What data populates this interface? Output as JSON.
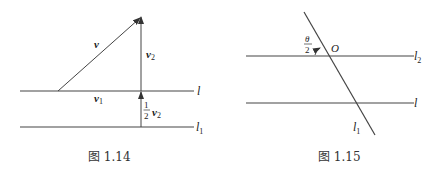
{
  "figures": [
    {
      "id": "fig-1-14",
      "caption": "图 1.14",
      "lines": [
        {
          "name": "l",
          "label": "l"
        },
        {
          "name": "l1",
          "label": "l",
          "sub": "1"
        }
      ],
      "vectors": [
        {
          "name": "v",
          "label": "v"
        },
        {
          "name": "v2",
          "label": "v",
          "sub": "2"
        },
        {
          "name": "v1",
          "label": "v",
          "sub": "1"
        },
        {
          "name": "half-v2",
          "frac_num": "1",
          "frac_den": "2",
          "label": "v",
          "sub": "2"
        }
      ]
    },
    {
      "id": "fig-1-15",
      "caption": "图 1.15",
      "lines": [
        {
          "name": "l2",
          "label": "l",
          "sub": "2"
        },
        {
          "name": "l",
          "label": "l"
        },
        {
          "name": "l1",
          "label": "l",
          "sub": "1"
        }
      ],
      "point": {
        "name": "O",
        "label": "O"
      },
      "angle": {
        "frac_num": "θ",
        "frac_den": "2"
      }
    }
  ],
  "colors": {
    "line": "#444444",
    "text": "#222222",
    "background": "#ffffff"
  }
}
